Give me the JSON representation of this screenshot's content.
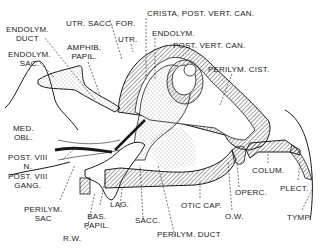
{
  "diagram": {
    "colors": {
      "ink": "#1a1a1a",
      "background": "#ffffff",
      "hatch": "#333333",
      "stipple": "#555555"
    },
    "labels": [
      {
        "id": "endolym-duct",
        "lines": [
          "ENDOLYM.",
          "DUCT"
        ]
      },
      {
        "id": "endolym-sac",
        "lines": [
          "ENDOLYM.",
          "SAC."
        ]
      },
      {
        "id": "utr-sacc-for",
        "lines": [
          "UTR. SACC. FOR."
        ]
      },
      {
        "id": "amphib-papil",
        "lines": [
          "AMPHIB.",
          "PAPIL."
        ]
      },
      {
        "id": "utr",
        "lines": [
          "UTR."
        ]
      },
      {
        "id": "crista-post-vert-can",
        "lines": [
          "CRISTA, POST. VERT. CAN."
        ]
      },
      {
        "id": "endolym",
        "lines": [
          "ENDOLYM."
        ]
      },
      {
        "id": "post-vert-can",
        "lines": [
          "POST. VERT. CAN."
        ]
      },
      {
        "id": "perilym-cist",
        "lines": [
          "PERILYM. CIST."
        ]
      },
      {
        "id": "med-obl",
        "lines": [
          "MED.",
          "OBL."
        ]
      },
      {
        "id": "post-viii-n",
        "lines": [
          "POST. VIII",
          "N."
        ]
      },
      {
        "id": "post-viii-gang",
        "lines": [
          "POST. VIII",
          "GANG."
        ]
      },
      {
        "id": "perilym-sac",
        "lines": [
          "PERILYM.",
          "SAC"
        ]
      },
      {
        "id": "bas-papil",
        "lines": [
          "BAS.",
          "PAPIL."
        ]
      },
      {
        "id": "r-w",
        "lines": [
          "R.W."
        ]
      },
      {
        "id": "lag",
        "lines": [
          "LAG."
        ]
      },
      {
        "id": "sacc",
        "lines": [
          "SACC."
        ]
      },
      {
        "id": "perilym-duct",
        "lines": [
          "PERILYM. DUCT"
        ]
      },
      {
        "id": "otic-cap",
        "lines": [
          "OTIC CAP."
        ]
      },
      {
        "id": "o-w",
        "lines": [
          "O.W."
        ]
      },
      {
        "id": "operc",
        "lines": [
          "OPERC."
        ]
      },
      {
        "id": "colum",
        "lines": [
          "COLUM."
        ]
      },
      {
        "id": "plect",
        "lines": [
          "PLECT."
        ]
      },
      {
        "id": "tymp",
        "lines": [
          "TYMP."
        ]
      }
    ]
  }
}
